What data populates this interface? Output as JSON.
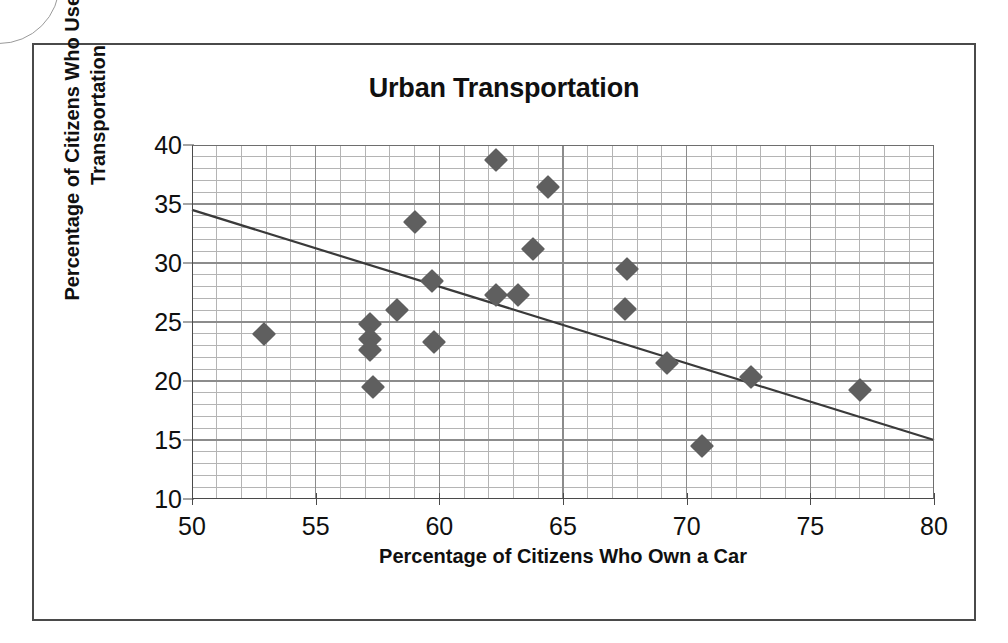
{
  "figure": {
    "title": "Urban Transportation",
    "x_axis_title": "Percentage of Citizens Who Own a Car",
    "y_axis_title_line1": "Percentage of Citizens Who Use Public",
    "y_axis_title_line2": "Transportation",
    "marker_color": "#5f5f5f",
    "grid_color": "#8c8c8c",
    "axis_color": "#4a4a4a",
    "frame_color": "#4a4a4a"
  },
  "chart_data": {
    "type": "scatter",
    "title": "Urban Transportation",
    "xlabel": "Percentage of Citizens Who Own a Car",
    "ylabel": "Percentage of Citizens Who Use Public Transportation",
    "xlim": [
      50,
      80
    ],
    "ylim": [
      10,
      40
    ],
    "xticks": [
      50,
      55,
      60,
      65,
      70,
      75,
      80
    ],
    "yticks": [
      10,
      15,
      20,
      25,
      30,
      35,
      40
    ],
    "x_minor_step": 1,
    "y_minor_step": 1,
    "grid": true,
    "legend": "none",
    "points": [
      {
        "x": 52.9,
        "y": 24.0
      },
      {
        "x": 57.2,
        "y": 24.8
      },
      {
        "x": 57.2,
        "y": 23.6
      },
      {
        "x": 57.2,
        "y": 22.6
      },
      {
        "x": 57.3,
        "y": 19.5
      },
      {
        "x": 58.3,
        "y": 26.0
      },
      {
        "x": 59.0,
        "y": 33.5
      },
      {
        "x": 59.7,
        "y": 28.5
      },
      {
        "x": 59.8,
        "y": 23.3
      },
      {
        "x": 62.3,
        "y": 38.7
      },
      {
        "x": 62.3,
        "y": 27.3
      },
      {
        "x": 63.2,
        "y": 27.3
      },
      {
        "x": 63.8,
        "y": 31.2
      },
      {
        "x": 64.4,
        "y": 36.4
      },
      {
        "x": 67.6,
        "y": 29.5
      },
      {
        "x": 67.5,
        "y": 26.1
      },
      {
        "x": 69.2,
        "y": 21.5
      },
      {
        "x": 70.6,
        "y": 14.5
      },
      {
        "x": 72.6,
        "y": 20.3
      },
      {
        "x": 77.0,
        "y": 19.2
      }
    ],
    "trendline": {
      "type": "linear",
      "x_start": 50,
      "y_start": 34.5,
      "x_end": 80,
      "y_end": 15.0
    }
  }
}
